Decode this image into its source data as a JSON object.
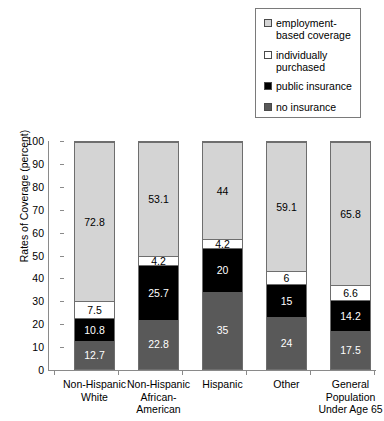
{
  "chart_data": {
    "type": "bar",
    "subtype": "stacked-100",
    "title": "",
    "xlabel": "",
    "ylabel": "Rates of Coverage (percent)",
    "ylim": [
      0,
      100
    ],
    "yticks": [
      0,
      10,
      20,
      30,
      40,
      50,
      60,
      70,
      80,
      90,
      100
    ],
    "grid": false,
    "legend_position": "top-right",
    "categories": [
      "Non-Hispanic White",
      "Non-Hispanic African-American",
      "Hispanic",
      "Other",
      "General Population Under Age 65"
    ],
    "category_labels_wrapped": [
      "Non-Hispanic\nWhite",
      "Non-Hispanic\nAfrican-\nAmerican",
      "Hispanic",
      "Other",
      "General\nPopulation\nUnder Age 65"
    ],
    "series": [
      {
        "name": "no insurance",
        "color": "#595959",
        "values": [
          12.7,
          22.8,
          35,
          24,
          17.5
        ],
        "labels": [
          "12.7",
          "22.8",
          "35",
          "24",
          "17.5"
        ]
      },
      {
        "name": "public insurance",
        "color": "#000000",
        "values": [
          10.8,
          25.7,
          20,
          15,
          14.2
        ],
        "labels": [
          "10.8",
          "25.7",
          "20",
          "15",
          "14.2"
        ]
      },
      {
        "name": "individually purchased",
        "color": "#ffffff",
        "values": [
          7.5,
          4.2,
          4.2,
          6,
          6.6
        ],
        "labels": [
          "7.5",
          "4.2",
          "4.2",
          "6",
          "6.6"
        ]
      },
      {
        "name": "employment-based coverage",
        "color": "#d4d4d4",
        "values": [
          72.8,
          53.1,
          44,
          59.1,
          65.8
        ],
        "labels": [
          "72.8",
          "53.1",
          "44",
          "59.1",
          "65.8"
        ]
      }
    ]
  },
  "legend": {
    "items": [
      {
        "label": "employment-\nbased coverage",
        "swatch_color": "#d4d4d4",
        "name": "employment-based-coverage"
      },
      {
        "label": "individually\npurchased",
        "swatch_color": "#ffffff",
        "name": "individually-purchased"
      },
      {
        "label": "public insurance",
        "swatch_color": "#000000",
        "name": "public-insurance"
      },
      {
        "label": "no insurance",
        "swatch_color": "#595959",
        "name": "no-insurance"
      }
    ]
  },
  "axis": {
    "y_title": "Rates of Coverage (percent)",
    "y_tick_labels": [
      "100",
      "90",
      "80",
      "70",
      "60",
      "50",
      "40",
      "30",
      "20",
      "10",
      "0"
    ]
  }
}
